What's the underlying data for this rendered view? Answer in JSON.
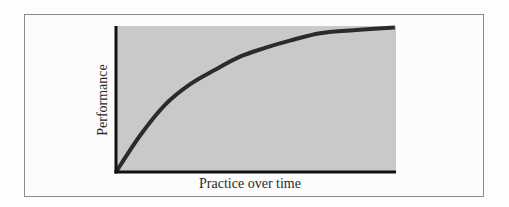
{
  "chart_data": {
    "type": "line",
    "title": "",
    "xlabel": "Practice over time",
    "ylabel": "Performance",
    "grid": false,
    "legend": null,
    "xlim": [
      0,
      10
    ],
    "ylim": [
      0,
      100
    ],
    "ticks": {
      "x": [],
      "y": []
    },
    "series": [
      {
        "name": "Learning curve",
        "x": [
          0,
          0.86,
          1.75,
          2.64,
          3.54,
          4.43,
          5.32,
          6.21,
          7.29,
          8.36,
          9.96
        ],
        "y": [
          0,
          25,
          46,
          60,
          70,
          79,
          85,
          90,
          95,
          97,
          99
        ]
      }
    ],
    "annotations": [],
    "colors": {
      "plot_background": "#c9c9c9",
      "curve": "#2b2b2b",
      "axes": "#111111",
      "frame_border": "#8a8a8a"
    }
  },
  "labels": {
    "x_axis": "Practice over time",
    "y_axis": "Performance"
  }
}
